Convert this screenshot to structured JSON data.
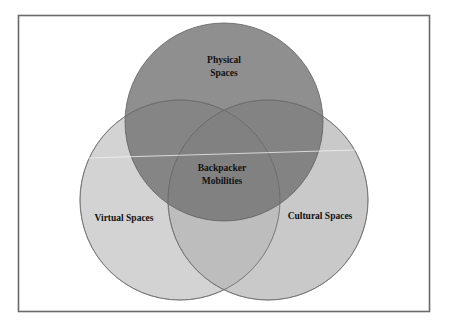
{
  "diagram": {
    "type": "venn",
    "frame": {
      "x": 18,
      "y": 15,
      "width": 412,
      "height": 297,
      "stroke": "#6a6a6a"
    },
    "circles": [
      {
        "id": "physical",
        "cx": 224,
        "cy": 122,
        "r": 99,
        "fill": "#7c7c7c",
        "opacity": 0.82,
        "stroke": "#5e5e5e"
      },
      {
        "id": "virtual",
        "cx": 180,
        "cy": 200,
        "r": 100,
        "fill": "#c4c4c4",
        "opacity": 0.72,
        "stroke": "#7a7a7a"
      },
      {
        "id": "cultural",
        "cx": 268,
        "cy": 200,
        "r": 100,
        "fill": "#b4b4b4",
        "opacity": 0.72,
        "stroke": "#7a7a7a"
      }
    ],
    "labels": {
      "physical": {
        "line1": "Physical",
        "line2": "Spaces"
      },
      "virtual": "Virtual Spaces",
      "cultural": "Cultural Spaces",
      "center": {
        "line1": "Backpacker",
        "line2": "Mobilities"
      }
    },
    "sets": [
      "Physical Spaces",
      "Virtual Spaces",
      "Cultural Spaces"
    ],
    "intersection": "Backpacker Mobilities"
  }
}
